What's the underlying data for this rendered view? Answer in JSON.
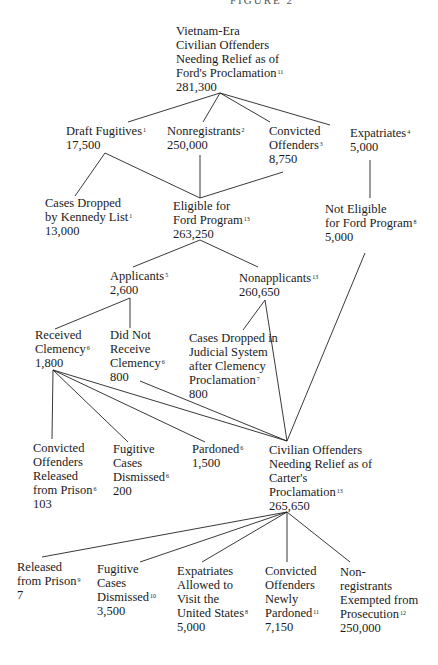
{
  "header": {
    "text": "FIGURE 2"
  },
  "nodes": {
    "root": {
      "lines": [
        "Vietnam-Era",
        "Civilian Offenders",
        "Needing Relief as of",
        "Ford's Proclamation"
      ],
      "note": "11",
      "value": "281,300"
    },
    "draft_fugitives": {
      "lines": [
        "Draft Fugitives"
      ],
      "note": "1",
      "value": "17,500"
    },
    "nonregistrants": {
      "lines": [
        "Nonregistrants"
      ],
      "note": "2",
      "value": "250,000"
    },
    "convicted_offenders": {
      "lines": [
        "Convicted",
        "Offenders"
      ],
      "note": "3",
      "value": "8,750"
    },
    "expatriates": {
      "lines": [
        "Expatriates"
      ],
      "note": "4",
      "value": "5,000"
    },
    "kennedy_list": {
      "lines": [
        "Cases Dropped",
        "by Kennedy List"
      ],
      "note": "1",
      "value": "13,000"
    },
    "eligible": {
      "lines": [
        "Eligible for",
        "Ford Program"
      ],
      "note": "13",
      "value": "263,250"
    },
    "not_eligible": {
      "lines": [
        "Not Eligible",
        "for Ford Program"
      ],
      "note": "8",
      "value": "5,000"
    },
    "applicants": {
      "lines": [
        "Applicants"
      ],
      "note": "5",
      "value": "2,600"
    },
    "nonapplicants": {
      "lines": [
        "Nonapplicants"
      ],
      "note": "13",
      "value": "260,650"
    },
    "received_clemency": {
      "lines": [
        "Received",
        "Clemency"
      ],
      "note": "6",
      "value": "1,800"
    },
    "not_received_clemency": {
      "lines": [
        "Did Not",
        "Receive",
        "Clemency"
      ],
      "note": "6",
      "value": "800"
    },
    "judicial_dropped": {
      "lines": [
        "Cases Dropped in",
        "Judicial System",
        "after Clemency",
        "Proclamation"
      ],
      "note": "7",
      "value": "800"
    },
    "released_prison_ford": {
      "lines": [
        "Convicted",
        "Offenders",
        "Released",
        "from Prison"
      ],
      "note": "6",
      "value": "103"
    },
    "fugitive_dismissed_ford": {
      "lines": [
        "Fugitive",
        "Cases",
        "Dismissed"
      ],
      "note": "6",
      "value": "200"
    },
    "pardoned": {
      "lines": [
        "Pardoned"
      ],
      "note": "6",
      "value": "1,500"
    },
    "carter": {
      "lines": [
        "Civilian Offenders",
        "Needing Relief as of",
        "Carter's",
        "Proclamation"
      ],
      "note": "13",
      "value": "265,650"
    },
    "released_prison_carter": {
      "lines": [
        "Released",
        "from Prison"
      ],
      "note": "9",
      "value": "7"
    },
    "fugitive_dismissed_carter": {
      "lines": [
        "Fugitive",
        "Cases",
        "Dismissed"
      ],
      "note": "10",
      "value": "3,500"
    },
    "expatriates_visit": {
      "lines": [
        "Expatriates",
        "Allowed to",
        "Visit the",
        "United States"
      ],
      "note": "8",
      "value": "5,000"
    },
    "newly_pardoned": {
      "lines": [
        "Convicted",
        "Offenders",
        "Newly",
        "Pardoned"
      ],
      "note": "11",
      "value": "7,150"
    },
    "nonregistrants_exempted": {
      "lines": [
        "Non-",
        "registrants",
        "Exempted from",
        "Prosecution"
      ],
      "note": "12",
      "value": "250,000"
    }
  }
}
